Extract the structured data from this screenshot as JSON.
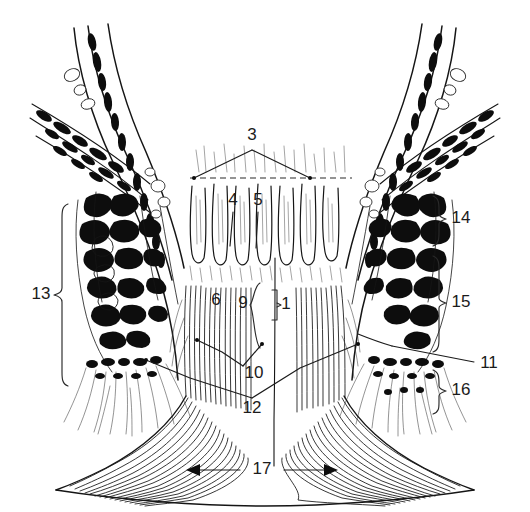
{
  "figure": {
    "background_color": "#ffffff",
    "ink_color": "#141414",
    "label_color": "#1b1b1b",
    "width": 530,
    "height": 512
  },
  "labels": [
    {
      "id": "1",
      "text": "1",
      "x": 286,
      "y": 305,
      "marker": "bracket-right-small"
    },
    {
      "id": "3",
      "text": "3",
      "x": 252,
      "y": 136,
      "marker": "two-leaders-to-dashed-line"
    },
    {
      "id": "4",
      "text": "4",
      "x": 233,
      "y": 201,
      "marker": "leader-down"
    },
    {
      "id": "5",
      "text": "5",
      "x": 258,
      "y": 201,
      "marker": "leader-down"
    },
    {
      "id": "6",
      "text": "6",
      "x": 216,
      "y": 301,
      "marker": "plain"
    },
    {
      "id": "9",
      "text": "9",
      "x": 243,
      "y": 304,
      "marker": "bracket-left-small"
    },
    {
      "id": "10",
      "text": "10",
      "x": 254,
      "y": 374,
      "marker": "leader-elbow-left"
    },
    {
      "id": "11",
      "text": "11",
      "x": 489,
      "y": 364,
      "marker": "leader-left-long"
    },
    {
      "id": "12",
      "text": "12",
      "x": 252,
      "y": 409,
      "marker": "leader-v-both-sides"
    },
    {
      "id": "13",
      "text": "13",
      "x": 41,
      "y": 295,
      "marker": "bracket-left-tall"
    },
    {
      "id": "14",
      "text": "14",
      "x": 461,
      "y": 219,
      "marker": "bracket-right"
    },
    {
      "id": "15",
      "text": "15",
      "x": 461,
      "y": 303,
      "marker": "bracket-right"
    },
    {
      "id": "16",
      "text": "16",
      "x": 461,
      "y": 391,
      "marker": "bracket-right"
    },
    {
      "id": "17",
      "text": "17",
      "x": 262,
      "y": 470,
      "marker": "double-headed-arrow"
    }
  ],
  "brackets": {
    "left_13": {
      "x": 62,
      "y_top": 204,
      "y_bottom": 385,
      "tip_y": 295
    },
    "right_14": {
      "x": 439,
      "y_top": 196,
      "y_bottom": 246,
      "tip_y": 219
    },
    "right_15": {
      "x": 439,
      "y_top": 256,
      "y_bottom": 352,
      "tip_y": 303
    },
    "right_16": {
      "x": 439,
      "y_top": 370,
      "y_bottom": 414,
      "tip_y": 391
    },
    "center_9": {
      "x": 256,
      "y_top": 283,
      "y_bottom": 348,
      "tip_y": 305
    },
    "center_1": {
      "x": 277,
      "y_top": 290,
      "y_bottom": 320,
      "tip_y": 305
    }
  },
  "guides": {
    "dashed_line": {
      "x1": 190,
      "x2": 352,
      "y": 178
    },
    "label3_apex": {
      "x": 252,
      "y": 150
    },
    "arrow_17": {
      "x1": 188,
      "x2": 336,
      "y": 470
    }
  }
}
